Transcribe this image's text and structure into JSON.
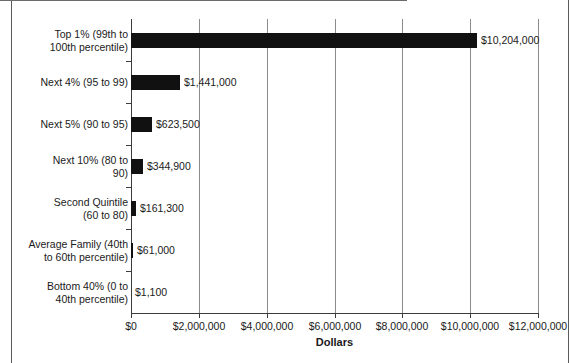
{
  "chart_data": {
    "type": "bar",
    "orientation": "horizontal",
    "title": "",
    "xlabel": "Dollars",
    "ylabel": "",
    "xlim": [
      0,
      12000000
    ],
    "grid": true,
    "legend": false,
    "categories": [
      "Top 1% (99th to 100th percentile)",
      "Next 4% (95 to 99)",
      "Next 5% (90 to 95)",
      "Next 10% (80 to 90)",
      "Second Quintile (60 to 80)",
      "Average Family (40th to 60th percentile)",
      "Bottom 40% (0 to 40th percentile)"
    ],
    "values": [
      10204000,
      1441000,
      623500,
      344900,
      161300,
      61000,
      1100
    ],
    "value_labels": [
      "$10,204,000",
      "$1,441,000",
      "$623,500",
      "$344,900",
      "$161,300",
      "$61,000",
      "$1,100"
    ],
    "xticks": [
      0,
      2000000,
      4000000,
      6000000,
      8000000,
      10000000,
      12000000
    ],
    "xtick_labels": [
      "$0",
      "$2,000,000",
      "$4,000,000",
      "$6,000,000",
      "$8,000,000",
      "$10,000,000",
      "$12,000,000"
    ],
    "bar_color": "#111111",
    "grid_color": "#8c8c8c",
    "axis_color": "#3c3c3c",
    "background_color": "#ffffff"
  },
  "category_label_lines": [
    [
      "Top 1% (99th to",
      "100th percentile)"
    ],
    [
      "Next 4% (95 to 99)"
    ],
    [
      "Next 5% (90 to 95)"
    ],
    [
      "Next 10% (80 to",
      "90)"
    ],
    [
      "Second Quintile",
      "(60 to 80)"
    ],
    [
      "Average Family (40th",
      "to 60th percentile)"
    ],
    [
      "Bottom 40% (0 to",
      "40th percentile)"
    ]
  ]
}
